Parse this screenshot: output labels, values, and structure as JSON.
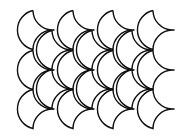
{
  "pattern": {
    "name": "fish-scale tessellation",
    "stroke_color": "#111111",
    "background": "#ffffff",
    "scale_half_width": 19,
    "scale_half_height": 19.5,
    "main_rows": {
      "cusp_x": [
        52,
        92,
        132,
        172
      ],
      "cusp_y": [
        30,
        70,
        109
      ]
    },
    "offset_rows": {
      "cusp_x": [
        71,
        111,
        151
      ],
      "cusp_y": [
        50,
        89
      ]
    }
  }
}
